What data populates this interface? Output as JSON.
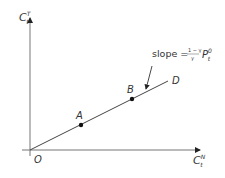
{
  "diagram": {
    "y_axis": {
      "label": "C",
      "sup": "T",
      "sub": "t"
    },
    "x_axis": {
      "label": "C",
      "sup": "N",
      "sub": "t"
    },
    "origin_label": "O",
    "line_label": "D",
    "points": [
      {
        "label": "A",
        "x": 81,
        "y": 126
      },
      {
        "label": "B",
        "x": 132,
        "y": 100
      }
    ],
    "annotation": {
      "prefix": "slope =",
      "numerator": "1 − γ",
      "denominator": "γ",
      "var": "P",
      "var_sub": "t",
      "var_sup": "0"
    },
    "colors": {
      "line": "#444444",
      "axis": "#555555",
      "text": "#333333"
    }
  }
}
